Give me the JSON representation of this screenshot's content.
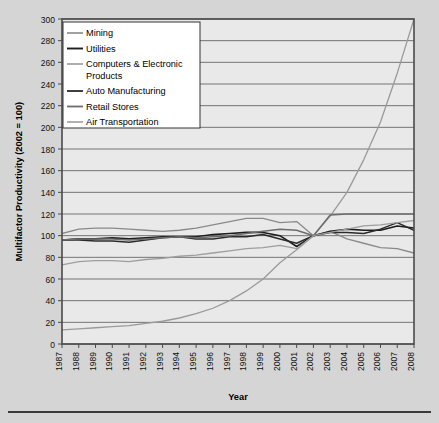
{
  "figure": {
    "background_color": "#d5d5d5",
    "plot_background_color": "#e9e9e9",
    "frame_color": "#4a4a4a",
    "gridline_color": "#555555"
  },
  "chart_data": {
    "type": "line",
    "title": "",
    "xlabel": "Year",
    "ylabel": "Multifactor Productivity (2002 = 100)",
    "xlim": [
      1987,
      2008
    ],
    "ylim": [
      0,
      300
    ],
    "ytick_step": 20,
    "grid": true,
    "legend_position": "top-left-inside",
    "x": [
      1987,
      1988,
      1989,
      1990,
      1991,
      1992,
      1993,
      1994,
      1995,
      1996,
      1997,
      1998,
      1999,
      2000,
      2001,
      2002,
      2003,
      2004,
      2005,
      2006,
      2007,
      2008
    ],
    "yticks": [
      0,
      20,
      40,
      60,
      80,
      100,
      120,
      140,
      160,
      180,
      200,
      220,
      240,
      260,
      280,
      300
    ],
    "xticks": [
      "1987",
      "1988",
      "1989",
      "1990",
      "1991",
      "1992",
      "1993",
      "1994",
      "1995",
      "1996",
      "1997",
      "1998",
      "1999",
      "2000",
      "2001",
      "2002",
      "2003",
      "2004",
      "2005",
      "2006",
      "2007",
      "2008"
    ],
    "series": [
      {
        "name": "Mining",
        "color": "#8a8a8a",
        "width": 1.3,
        "values": [
          102,
          106,
          107,
          107,
          106,
          105,
          104,
          105,
          107,
          110,
          113,
          116,
          116,
          112,
          113,
          100,
          104,
          97,
          93,
          89,
          88,
          84
        ]
      },
      {
        "name": "Utilities",
        "color": "#1d1d1d",
        "width": 1.6,
        "values": [
          96,
          97,
          97,
          98,
          97,
          98,
          99,
          99,
          99,
          101,
          102,
          103,
          103,
          100,
          90,
          100,
          104,
          106,
          105,
          105,
          109,
          107
        ]
      },
      {
        "name": "Computers & Electronic Products",
        "color": "#9a9a9a",
        "width": 1.3,
        "values": [
          13,
          14,
          15,
          16,
          17,
          19,
          21,
          24,
          28,
          33,
          40,
          49,
          60,
          75,
          87,
          100,
          118,
          140,
          170,
          205,
          250,
          300
        ]
      },
      {
        "name": "Auto Manufacturing",
        "color": "#2b2b2b",
        "width": 1.5,
        "values": [
          96,
          96,
          95,
          95,
          94,
          96,
          98,
          99,
          97,
          97,
          99,
          99,
          101,
          97,
          93,
          100,
          103,
          103,
          102,
          106,
          112,
          105
        ]
      },
      {
        "name": "Retail Stores",
        "color": "#6d6d6d",
        "width": 1.5,
        "values": [
          96,
          97,
          97,
          97,
          96,
          97,
          98,
          99,
          98,
          99,
          100,
          102,
          104,
          106,
          105,
          100,
          119,
          120,
          120,
          120,
          120,
          120
        ]
      },
      {
        "name": "Air Transportation",
        "color": "#9e9e9e",
        "width": 1.3,
        "values": [
          73,
          76,
          77,
          77,
          76,
          78,
          79,
          81,
          82,
          84,
          86,
          88,
          89,
          91,
          88,
          100,
          103,
          106,
          109,
          110,
          112,
          114
        ]
      }
    ]
  },
  "legend": {
    "items": [
      {
        "label": "Mining"
      },
      {
        "label": "Utilities"
      },
      {
        "label": "Computers & Electronic"
      },
      {
        "label": "Products"
      },
      {
        "label": "Auto Manufacturing"
      },
      {
        "label": "Retail Stores"
      },
      {
        "label": "Air Transportation"
      }
    ]
  }
}
